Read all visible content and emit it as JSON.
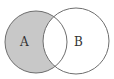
{
  "diagram": {
    "type": "venn",
    "shaded_region": "A minus B",
    "sets": [
      {
        "label": "A",
        "cx": 36,
        "cy": 42,
        "r": 31
      },
      {
        "label": "B",
        "cx": 76,
        "cy": 41,
        "r": 33
      }
    ],
    "colors": {
      "shade": "#c8c8c8",
      "stroke": "#6e6e6e",
      "background": "#ffffff"
    }
  }
}
